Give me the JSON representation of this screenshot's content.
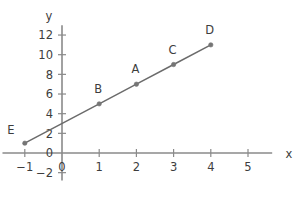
{
  "chart_data": {
    "type": "line",
    "title": "",
    "subtitle": "",
    "xlabel": "x",
    "ylabel": "y",
    "xlim": [
      -1.6,
      6.0
    ],
    "ylim": [
      -2.8,
      13.2
    ],
    "grid": false,
    "legend_position": "none",
    "x_ticks": [
      -1,
      0,
      1,
      2,
      3,
      4,
      5
    ],
    "x_tick_labels": [
      "−1",
      "0",
      "1",
      "2",
      "3",
      "4",
      "5"
    ],
    "y_ticks": [
      -2,
      0,
      2,
      4,
      6,
      8,
      10,
      12
    ],
    "y_tick_labels": [
      "−2",
      "0",
      "2",
      "4",
      "6",
      "8",
      "10",
      "12"
    ],
    "series": [
      {
        "name": "line",
        "equation": "y = 2x + 3",
        "x": [
          -1,
          1,
          2,
          3,
          4
        ],
        "values": [
          1,
          5,
          7,
          9,
          11
        ]
      }
    ],
    "annotations": [
      {
        "label": "E",
        "x": -1,
        "y": 1,
        "label_dx": -14,
        "label_dy": -9
      },
      {
        "label": "B",
        "x": 1,
        "y": 5,
        "label_dx": -1,
        "label_dy": -11
      },
      {
        "label": "A",
        "x": 2,
        "y": 7,
        "label_dx": -1,
        "label_dy": -11
      },
      {
        "label": "C",
        "x": 3,
        "y": 9,
        "label_dx": -1,
        "label_dy": -11
      },
      {
        "label": "D",
        "x": 4,
        "y": 11,
        "label_dx": -1,
        "label_dy": -11
      }
    ],
    "colors": {
      "axis": "#8a8a8a",
      "line": "#6b6b6b",
      "point": "#757575",
      "text": "#3d3d3d",
      "background": "#ffffff"
    }
  }
}
